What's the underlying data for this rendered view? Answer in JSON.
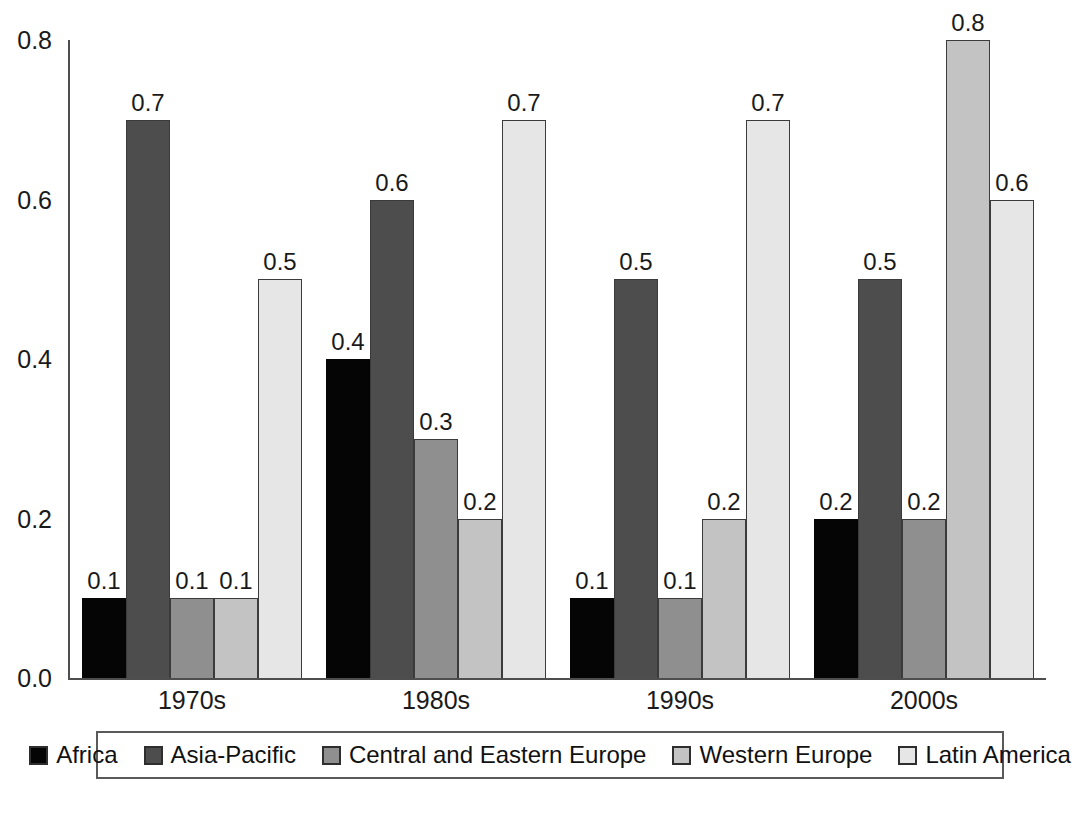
{
  "chart_data": {
    "type": "bar",
    "title": "",
    "subtitle": "",
    "xlabel": "",
    "ylabel": "",
    "ylim": [
      0.0,
      0.8
    ],
    "yticks": [
      "0.8",
      "0.6",
      "0.4",
      "0.2",
      "0.0"
    ],
    "ytick_values": [
      0.8,
      0.6,
      0.4,
      0.2,
      0.0
    ],
    "grid": false,
    "legend_position": "bottom",
    "categories": [
      "1970s",
      "1980s",
      "1990s",
      "2000s"
    ],
    "series": [
      {
        "name": "Africa",
        "color": "#050505",
        "values": [
          0.1,
          0.4,
          0.1,
          0.2
        ],
        "labels": [
          "0.1",
          "0.4",
          "0.1",
          "0.2"
        ]
      },
      {
        "name": "Asia-Pacific",
        "color": "#4d4d4d",
        "values": [
          0.7,
          0.6,
          0.5,
          0.5
        ],
        "labels": [
          "0.7",
          "0.6",
          "0.5",
          "0.5"
        ]
      },
      {
        "name": "Central and Eastern Europe",
        "color": "#8f8f8f",
        "values": [
          0.1,
          0.3,
          0.1,
          0.2
        ],
        "labels": [
          "0.1",
          "0.3",
          "0.1",
          "0.2"
        ]
      },
      {
        "name": "Western Europe",
        "color": "#c3c3c3",
        "values": [
          0.1,
          0.2,
          0.2,
          0.8
        ],
        "labels": [
          "0.1",
          "0.2",
          "0.2",
          "0.8"
        ]
      },
      {
        "name": "Latin America",
        "color": "#e6e6e6",
        "values": [
          0.5,
          0.7,
          0.7,
          0.6
        ],
        "labels": [
          "0.5",
          "0.7",
          "0.7",
          "0.6"
        ]
      }
    ]
  }
}
